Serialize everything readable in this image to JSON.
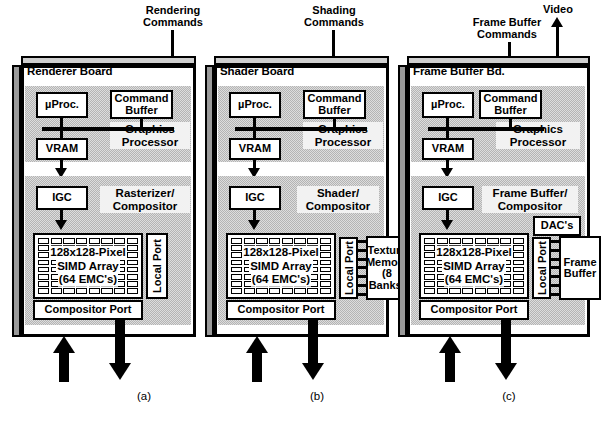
{
  "figure": {
    "kind": "block-diagram",
    "panels": [
      {
        "key": "a",
        "caption": "(a)",
        "external_input_label": "Rendering\nCommands",
        "board_title": "Renderer Board",
        "zones": [
          {
            "key": "graphics-processor",
            "label": "Graphics\nProcessor"
          },
          {
            "key": "rasterizer-compositor",
            "label": "Rasterizer/\nCompositor"
          }
        ],
        "blocks": [
          {
            "key": "uproc",
            "label": "µProc."
          },
          {
            "key": "command-buffer",
            "label": "Command\nBuffer"
          },
          {
            "key": "vram",
            "label": "VRAM"
          },
          {
            "key": "igc",
            "label": "IGC"
          },
          {
            "key": "compositor-port",
            "label": "Compositor Port"
          }
        ],
        "simd": {
          "lines": [
            "128x128-Pixel",
            "SIMD Array",
            "(64 EMC's)"
          ],
          "columns": 8,
          "rows": 8
        },
        "local_port": "Local Port",
        "side_blocks": [],
        "video_output": null
      },
      {
        "key": "b",
        "caption": "(b)",
        "external_input_label": "Shading\nCommands",
        "board_title": "Shader Board",
        "zones": [
          {
            "key": "graphics-processor",
            "label": "Graphics\nProcessor"
          },
          {
            "key": "shader-compositor",
            "label": "Shader/\nCompositor"
          }
        ],
        "blocks": [
          {
            "key": "uproc",
            "label": "µProc."
          },
          {
            "key": "command-buffer",
            "label": "Command\nBuffer"
          },
          {
            "key": "vram",
            "label": "VRAM"
          },
          {
            "key": "igc",
            "label": "IGC"
          },
          {
            "key": "compositor-port",
            "label": "Compositor Port"
          }
        ],
        "simd": {
          "lines": [
            "128x128-Pixel",
            "SIMD Array",
            "(64 EMC's)"
          ],
          "columns": 8,
          "rows": 8
        },
        "local_port": "Local Port",
        "side_blocks": [
          {
            "key": "texture-memory",
            "label": "Texture\nMemory\n(8\nBanks)"
          }
        ],
        "video_output": null
      },
      {
        "key": "c",
        "caption": "(c)",
        "external_input_label": "Frame Buffer\nCommands",
        "board_title": "Frame Buffer Bd.",
        "zones": [
          {
            "key": "graphics-processor",
            "label": "Graphics\nProcessor"
          },
          {
            "key": "frame-buffer-compositor",
            "label": "Frame Buffer/\nCompositor"
          }
        ],
        "blocks": [
          {
            "key": "uproc",
            "label": "µProc."
          },
          {
            "key": "command-buffer",
            "label": "Command\nBuffer"
          },
          {
            "key": "vram",
            "label": "VRAM"
          },
          {
            "key": "igc",
            "label": "IGC"
          },
          {
            "key": "compositor-port",
            "label": "Compositor Port"
          }
        ],
        "simd": {
          "lines": [
            "128x128-Pixel",
            "SIMD Array",
            "(64 EMC's)"
          ],
          "columns": 8,
          "rows": 8
        },
        "local_port": "Local Port",
        "side_blocks": [
          {
            "key": "dacs",
            "label": "DAC's"
          },
          {
            "key": "frame-buffer",
            "label": "Frame\nBuffer"
          }
        ],
        "video_output": "Video"
      }
    ],
    "colors": {
      "ink": "#000000",
      "board_face": "#ffffff",
      "zone_gray": "#b4b4b4",
      "slab_side": "#9a9a9a",
      "slab_top": "#cfcfcf"
    }
  }
}
